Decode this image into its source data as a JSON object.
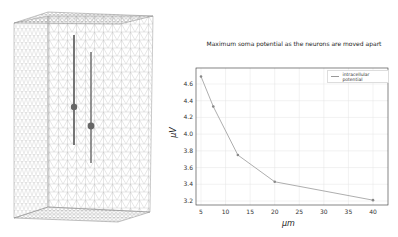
{
  "mesh": {
    "description": "3D tetrahedral mesh box with two vertical neurons",
    "neurons": [
      {
        "name": "left-neuron",
        "x": 74,
        "top": 35,
        "bottom": 145,
        "soma_y": 107
      },
      {
        "name": "right-neuron",
        "x": 91,
        "top": 52,
        "bottom": 163,
        "soma_y": 126
      }
    ]
  },
  "chart_data": {
    "type": "line",
    "title": "Maximum soma potential as the neurons are moved apart",
    "xlabel": "μm",
    "ylabel": "μV",
    "x": [
      5,
      7.5,
      12.5,
      20,
      40
    ],
    "series": [
      {
        "name": "intracellular potential",
        "values": [
          4.69,
          4.33,
          3.75,
          3.43,
          3.21
        ],
        "color": "#999999"
      }
    ],
    "xticks": [
      5,
      10,
      15,
      20,
      25,
      30,
      35,
      40
    ],
    "yticks": [
      3.2,
      3.4,
      3.6,
      3.8,
      4.0,
      4.2,
      4.4,
      4.6
    ],
    "xlim": [
      4,
      43.2
    ],
    "ylim": [
      3.15,
      4.76
    ],
    "grid": true,
    "legend_position": "upper right"
  },
  "labels": {
    "title": "Maximum soma potential as the neurons are moved apart",
    "xlabel": "μm",
    "ylabel": "μV",
    "legend": "intracellular potential"
  }
}
